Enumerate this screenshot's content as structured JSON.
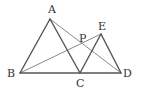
{
  "diagram": {
    "type": "geometry",
    "points": {
      "A": {
        "label": "A",
        "x": 50,
        "y": 19,
        "lx": 48,
        "ly": 13
      },
      "B": {
        "label": "B",
        "x": 20,
        "y": 73,
        "lx": 7,
        "ly": 77
      },
      "C": {
        "label": "C",
        "x": 80,
        "y": 73,
        "lx": 76,
        "ly": 87
      },
      "D": {
        "label": "D",
        "x": 121,
        "y": 73,
        "lx": 123,
        "ly": 77
      },
      "E": {
        "label": "E",
        "x": 101,
        "y": 34,
        "lx": 98,
        "ly": 30
      },
      "P": {
        "label": "P",
        "x": 82,
        "y": 45,
        "lx": 79,
        "ly": 42
      }
    },
    "segments": [
      {
        "from": "A",
        "to": "B",
        "weight": "thick"
      },
      {
        "from": "A",
        "to": "C",
        "weight": "thick"
      },
      {
        "from": "B",
        "to": "D",
        "weight": "thick"
      },
      {
        "from": "C",
        "to": "E",
        "weight": "thick"
      },
      {
        "from": "E",
        "to": "D",
        "weight": "thick"
      },
      {
        "from": "A",
        "to": "D",
        "weight": "thin"
      },
      {
        "from": "B",
        "to": "E",
        "weight": "thin"
      }
    ],
    "colors": {
      "line": "#555555",
      "label": "#333333"
    }
  }
}
